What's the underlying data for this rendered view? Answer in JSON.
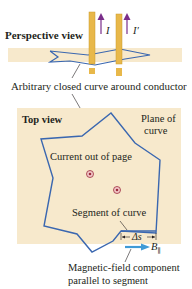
{
  "perspective": {
    "title": "Perspective view",
    "current_labels": [
      "I",
      "I′"
    ]
  },
  "callouts": {
    "closed_curve": "Arbitrary closed curve around conductor",
    "current_out": "Current out of page",
    "segment": "Segment of curve",
    "field_component_line1": "Magnetic-field component",
    "field_component_line2": "parallel to segment"
  },
  "top_view": {
    "title": "Top view",
    "plane_label_line1": "Plane of",
    "plane_label_line2": "curve",
    "delta_s": "Δs",
    "b_parallel": "B",
    "b_subscript": "∥"
  },
  "colors": {
    "plane": "#f7e9cc",
    "curve": "#3a67b0",
    "conductor": "#e8b84a",
    "current_arrow": "#7a2e8a",
    "field_arrow": "#3f9ad6",
    "dot": "#9b2a3c"
  }
}
